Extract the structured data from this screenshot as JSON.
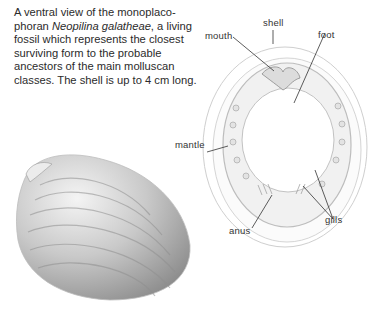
{
  "caption": {
    "part1": "A ventral view of the monoplaco-phoran ",
    "species": "Neopilina galatheae",
    "part2": ", a living fossil which represents the closest surviving form to the probable ancestors of the main molluscan classes. The shell is up to 4 cm long."
  },
  "labels": {
    "shell": "shell",
    "mouth": "mouth",
    "foot": "foot",
    "mantle": "mantle",
    "anus": "anus",
    "gills": "gills"
  },
  "illustrations": {
    "dorsal": "shell-illustration",
    "ventral": "ventral-view-illustration"
  }
}
